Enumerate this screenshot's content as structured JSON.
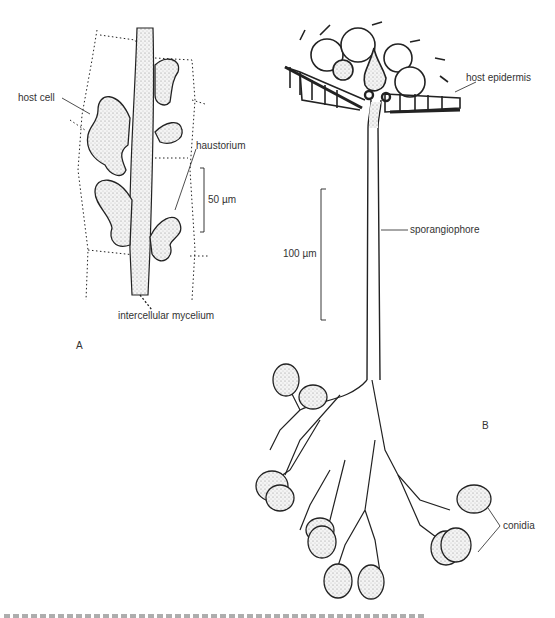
{
  "figure": {
    "panels": [
      {
        "id": "A",
        "label": "A",
        "annotations": {
          "host_cell": "host cell",
          "haustorium": "haustorium",
          "intercellular_mycelium": "intercellular mycelium",
          "scale_bar": "50 µm"
        }
      },
      {
        "id": "B",
        "label": "B",
        "annotations": {
          "host_epidermis": "host epidermis",
          "sporangiophore": "sporangiophore",
          "scale_bar": "100 µm",
          "conidia": "conidia"
        }
      }
    ],
    "colors": {
      "ink": "#222222",
      "stipple": "#bdbdbd",
      "background": "#ffffff"
    }
  }
}
